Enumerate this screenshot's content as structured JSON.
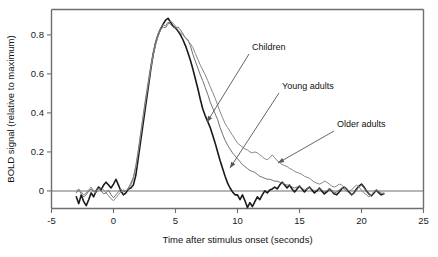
{
  "chart_data": {
    "type": "line",
    "title": "",
    "xlabel": "Time after stimulus onset (seconds)",
    "ylabel": "BOLD signal (relative to maximum)",
    "xlim": [
      -5,
      25
    ],
    "ylim": [
      -0.09,
      0.93
    ],
    "xticks": [
      -5,
      0,
      5,
      10,
      15,
      20,
      25
    ],
    "xtick_labels": [
      "-5",
      "0",
      "5",
      "10",
      "15",
      "20",
      "25"
    ],
    "yticks": [
      0,
      0.2,
      0.4,
      0.6,
      0.8
    ],
    "ytick_labels": [
      "0",
      "0.2",
      "0.4",
      "0.6",
      "0.8"
    ],
    "grid": false,
    "legend_position": "inline-annotations",
    "x": [
      -3.0,
      -2.8,
      -2.6,
      -2.4,
      -2.2,
      -2.0,
      -1.8,
      -1.6,
      -1.4,
      -1.2,
      -1.0,
      -0.8,
      -0.6,
      -0.4,
      -0.2,
      0.0,
      0.2,
      0.4,
      0.6,
      0.8,
      1.0,
      1.2,
      1.4,
      1.6,
      1.8,
      2.0,
      2.2,
      2.4,
      2.6,
      2.8,
      3.0,
      3.2,
      3.4,
      3.6,
      3.8,
      4.0,
      4.2,
      4.4,
      4.6,
      4.8,
      5.0,
      5.2,
      5.4,
      5.6,
      5.8,
      6.0,
      6.2,
      6.4,
      6.6,
      6.8,
      7.0,
      7.2,
      7.4,
      7.6,
      7.8,
      8.0,
      8.2,
      8.4,
      8.6,
      8.8,
      9.0,
      9.2,
      9.4,
      9.6,
      9.8,
      10.0,
      10.2,
      10.4,
      10.6,
      10.8,
      11.0,
      11.2,
      11.4,
      11.6,
      11.8,
      12.0,
      12.2,
      12.4,
      12.6,
      12.8,
      13.0,
      13.2,
      13.4,
      13.6,
      13.8,
      14.0,
      14.2,
      14.4,
      14.6,
      14.8,
      15.0,
      15.2,
      15.4,
      15.6,
      15.8,
      16.0,
      16.2,
      16.4,
      16.6,
      16.8,
      17.0,
      17.2,
      17.4,
      17.6,
      17.8,
      18.0,
      18.2,
      18.4,
      18.6,
      18.8,
      19.0,
      19.2,
      19.4,
      19.6,
      19.8,
      20.0,
      20.2,
      20.4,
      20.6,
      20.8,
      21.0,
      21.2,
      21.4,
      21.6,
      21.8
    ],
    "series": [
      {
        "name": "Children",
        "color": "#1a1a1a",
        "stroke_width": 1.6,
        "annotation": "Children",
        "description": "Thick black curve: sharpest rise and fastest return to baseline, undershoots below zero near 10-11 s",
        "values": [
          -0.03,
          -0.065,
          -0.02,
          -0.055,
          -0.075,
          -0.045,
          -0.01,
          -0.03,
          0.0,
          0.02,
          0.005,
          0.03,
          0.045,
          0.03,
          0.015,
          0.035,
          0.06,
          0.03,
          0.0,
          -0.02,
          -0.01,
          0.01,
          0.015,
          0.03,
          0.08,
          0.17,
          0.26,
          0.35,
          0.44,
          0.53,
          0.62,
          0.7,
          0.76,
          0.8,
          0.83,
          0.855,
          0.875,
          0.885,
          0.865,
          0.845,
          0.835,
          0.82,
          0.8,
          0.775,
          0.745,
          0.71,
          0.67,
          0.625,
          0.575,
          0.525,
          0.47,
          0.42,
          0.385,
          0.355,
          0.325,
          0.285,
          0.245,
          0.2,
          0.155,
          0.115,
          0.075,
          0.04,
          0.015,
          -0.005,
          -0.02,
          -0.02,
          -0.045,
          -0.02,
          -0.05,
          -0.085,
          -0.06,
          -0.08,
          -0.055,
          -0.03,
          -0.045,
          -0.02,
          0.0,
          -0.01,
          0.005,
          0.01,
          0.02,
          0.01,
          0.03,
          0.045,
          0.03,
          0.015,
          0.03,
          0.01,
          -0.005,
          0.01,
          0.025,
          0.01,
          -0.005,
          0.01,
          0.02,
          0.005,
          -0.01,
          0.0,
          0.015,
          0.0,
          -0.015,
          -0.005,
          0.01,
          0.0,
          -0.015,
          -0.02,
          -0.005,
          0.01,
          0.02,
          0.01,
          -0.005,
          -0.02,
          -0.01,
          0.01,
          0.025,
          0.035,
          0.02,
          0.0,
          -0.015,
          -0.025,
          -0.01,
          0.005,
          -0.01,
          -0.02,
          -0.015
        ]
      },
      {
        "name": "Young adults",
        "color": "#707070",
        "stroke_width": 1.0,
        "annotation": "Young adults",
        "description": "Medium gray curve: intermediate decay, settles toward baseline around 12-13 s",
        "values": [
          -0.01,
          0.005,
          -0.015,
          -0.03,
          -0.02,
          0.0,
          0.01,
          -0.005,
          0.0,
          0.015,
          0.0,
          -0.015,
          -0.01,
          0.005,
          -0.02,
          -0.035,
          -0.02,
          -0.005,
          0.01,
          -0.005,
          0.0,
          0.015,
          0.04,
          0.07,
          0.13,
          0.21,
          0.3,
          0.39,
          0.48,
          0.56,
          0.64,
          0.71,
          0.765,
          0.805,
          0.835,
          0.855,
          0.845,
          0.865,
          0.855,
          0.84,
          0.835,
          0.84,
          0.825,
          0.805,
          0.785,
          0.775,
          0.745,
          0.7,
          0.665,
          0.63,
          0.595,
          0.565,
          0.53,
          0.495,
          0.455,
          0.425,
          0.395,
          0.365,
          0.325,
          0.29,
          0.26,
          0.235,
          0.215,
          0.195,
          0.18,
          0.165,
          0.15,
          0.135,
          0.125,
          0.115,
          0.105,
          0.1,
          0.095,
          0.085,
          0.075,
          0.07,
          0.065,
          0.06,
          0.06,
          0.055,
          0.05,
          0.05,
          0.045,
          0.04,
          0.035,
          0.03,
          0.03,
          0.02,
          0.015,
          0.02,
          0.025,
          0.015,
          0.005,
          0.01,
          0.02,
          0.01,
          0.0,
          0.005,
          0.015,
          0.005,
          -0.005,
          0.0,
          0.01,
          0.0,
          -0.01,
          -0.005,
          0.005,
          0.015,
          0.01,
          0.0,
          -0.01,
          -0.02,
          -0.01,
          0.005,
          0.02,
          0.03,
          0.015,
          0.0,
          -0.015,
          -0.02,
          -0.005,
          0.005,
          -0.005,
          -0.015,
          -0.01
        ]
      },
      {
        "name": "Older adults",
        "color": "#888888",
        "stroke_width": 1.0,
        "annotation": "Older adults",
        "description": "Light gray curve: slowest decay, elevated plateau near 0.2 between 9 and 13 s",
        "values": [
          0.0,
          0.01,
          -0.005,
          -0.02,
          -0.01,
          0.005,
          0.02,
          0.0,
          -0.01,
          0.005,
          0.02,
          0.005,
          -0.01,
          -0.025,
          -0.04,
          -0.05,
          -0.035,
          -0.02,
          -0.005,
          0.005,
          0.0,
          0.01,
          0.03,
          0.06,
          0.12,
          0.2,
          0.29,
          0.38,
          0.465,
          0.545,
          0.625,
          0.695,
          0.75,
          0.795,
          0.825,
          0.84,
          0.835,
          0.855,
          0.87,
          0.86,
          0.845,
          0.825,
          0.81,
          0.8,
          0.785,
          0.77,
          0.755,
          0.735,
          0.705,
          0.675,
          0.645,
          0.62,
          0.595,
          0.565,
          0.535,
          0.505,
          0.475,
          0.44,
          0.405,
          0.375,
          0.345,
          0.325,
          0.305,
          0.285,
          0.265,
          0.245,
          0.235,
          0.225,
          0.215,
          0.21,
          0.2,
          0.195,
          0.2,
          0.195,
          0.185,
          0.175,
          0.165,
          0.16,
          0.17,
          0.185,
          0.17,
          0.155,
          0.145,
          0.135,
          0.13,
          0.125,
          0.115,
          0.11,
          0.1,
          0.095,
          0.09,
          0.085,
          0.075,
          0.07,
          0.065,
          0.055,
          0.045,
          0.04,
          0.035,
          0.04,
          0.05,
          0.045,
          0.035,
          0.025,
          0.02,
          0.025,
          0.035,
          0.03,
          0.02,
          0.01,
          0.0,
          0.005,
          0.02,
          0.03,
          0.02,
          0.005,
          -0.01,
          -0.02,
          -0.03,
          -0.02,
          -0.005,
          0.005,
          0.0,
          -0.01,
          -0.015
        ]
      }
    ],
    "annotations": [
      {
        "label": "Children",
        "text_x": 252,
        "text_y": 50,
        "line_x1": 249,
        "line_y1": 54,
        "line_x2": 207,
        "line_y2": 122
      },
      {
        "label": "Young adults",
        "text_x": 282,
        "text_y": 89,
        "line_x1": 279,
        "line_y1": 93,
        "line_x2": 230,
        "line_y2": 168
      },
      {
        "label": "Older adults",
        "text_x": 337,
        "text_y": 127,
        "line_x1": 334,
        "line_y1": 131,
        "line_x2": 278,
        "line_y2": 163
      }
    ]
  }
}
